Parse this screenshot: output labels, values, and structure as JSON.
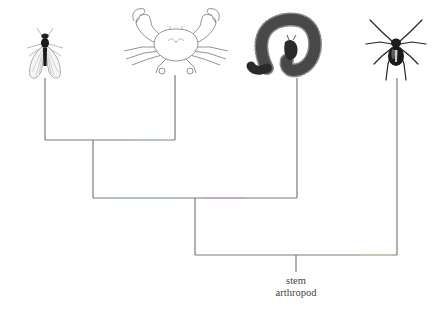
{
  "diagram": {
    "type": "cladogram",
    "line_color": "#7a7a7a",
    "taxa": [
      {
        "id": "fly",
        "name": "fly",
        "icon": "fly-icon",
        "x": 45,
        "line_top": 78
      },
      {
        "id": "crab",
        "name": "crab",
        "icon": "crab-icon",
        "x": 175,
        "line_top": 75
      },
      {
        "id": "millipede",
        "name": "millipede",
        "icon": "millipede-icon",
        "x": 297,
        "line_top": 78
      },
      {
        "id": "spider",
        "name": "spider",
        "icon": "spider-icon",
        "x": 397,
        "line_top": 78
      }
    ],
    "nodes": [
      {
        "id": "fly-crab",
        "y": 140,
        "x_left": 45,
        "x_right": 175,
        "stem_x": 93
      },
      {
        "id": "mandibulata",
        "y": 198,
        "x_left": 93,
        "x_right": 297,
        "stem_x": 195
      },
      {
        "id": "arthropoda",
        "y": 255,
        "x_left": 195,
        "x_right": 397,
        "stem_x": 296,
        "stem_bottom": 272
      }
    ],
    "root_label": {
      "line1": "stem",
      "line2": "arthropod"
    }
  }
}
